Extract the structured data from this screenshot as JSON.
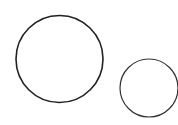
{
  "diagram": {
    "background": "#ffffff",
    "shapes": [
      {
        "type": "circle",
        "name": "large-circle",
        "cx": 59.5,
        "cy": 59,
        "r": 43.5,
        "stroke": "#222222",
        "stroke_width": 1.6,
        "fill": "none"
      },
      {
        "type": "circle",
        "name": "small-circle",
        "cx": 149,
        "cy": 88,
        "r": 29,
        "stroke": "#333333",
        "stroke_width": 1.2,
        "fill": "none"
      }
    ]
  }
}
